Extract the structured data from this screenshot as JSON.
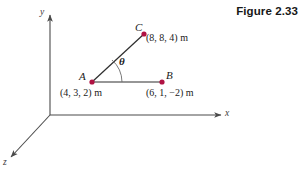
{
  "figure": {
    "caption": "Figure 2.33",
    "background_color": "#ffffff",
    "axis_color": "#4a4a4a",
    "vector_color": "#2e2e2e",
    "point_color": "#b01243",
    "text_color": "#1a1a1a"
  },
  "axes": [
    {
      "name": "y-axis",
      "label": "y",
      "label_x": 40,
      "label_y": 8
    },
    {
      "name": "x-axis",
      "label": "x",
      "label_x": 225,
      "label_y": 109
    },
    {
      "name": "z-axis",
      "label": "z",
      "label_x": 3,
      "label_y": 158
    }
  ],
  "points": [
    {
      "id": "A",
      "letter": "A",
      "coordinates": "(4, 3, 2) m",
      "letter_x": 79,
      "letter_y": 71,
      "coord_x": 60,
      "coord_y": 88,
      "dot_x": 92,
      "dot_y": 82
    },
    {
      "id": "B",
      "letter": "B",
      "coordinates": "(6, 1, −2) m",
      "letter_x": 166,
      "letter_y": 70,
      "coord_x": 146,
      "coord_y": 88,
      "dot_x": 162,
      "dot_y": 82
    },
    {
      "id": "C",
      "letter": "C",
      "coordinates": "(8, 8, 4) m",
      "letter_x": 135,
      "letter_y": 22,
      "coord_x": 146,
      "coord_y": 33,
      "dot_x": 144,
      "dot_y": 34
    }
  ],
  "angle": {
    "symbol": "θ",
    "label_x": 119,
    "label_y": 56,
    "vertex": "A",
    "between": "AC and AB"
  },
  "segments": [
    {
      "name": "segment-a-b",
      "from": "A",
      "to": "B"
    },
    {
      "name": "segment-a-c",
      "from": "A",
      "to": "C"
    }
  ]
}
